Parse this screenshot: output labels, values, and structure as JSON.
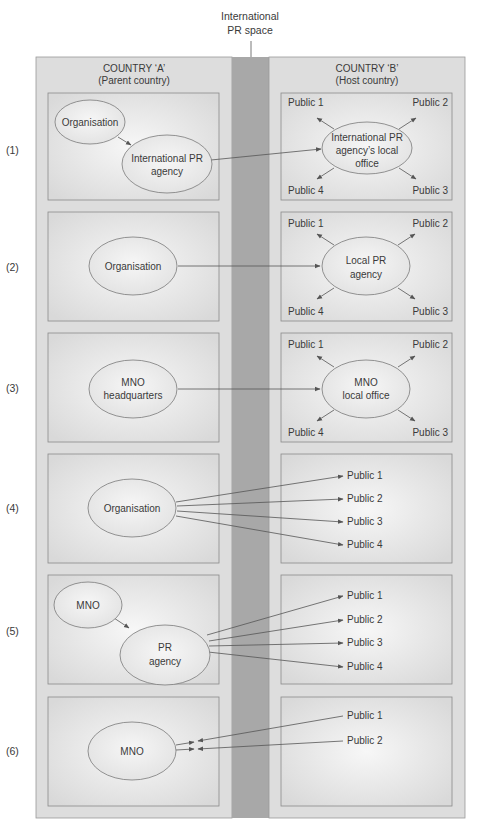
{
  "header": {
    "space_label_line1": "International",
    "space_label_line2": "PR space"
  },
  "columns": {
    "left": {
      "title": "COUNTRY ‘A’",
      "subtitle": "(Parent country)"
    },
    "right": {
      "title": "COUNTRY ‘B’",
      "subtitle": "(Host country)"
    }
  },
  "colors": {
    "panel": "#dcdcdc",
    "strip": "#a9a9a9",
    "box": "#e6e6e6",
    "ellipse": "#ececec",
    "stroke": "#6a6a6a"
  },
  "rows": [
    {
      "label": "(1)",
      "left_nodes": [
        {
          "lines": [
            "Organisation"
          ]
        },
        {
          "lines": [
            "International PR",
            "agency"
          ]
        }
      ],
      "right_node": {
        "lines": [
          "International PR",
          "agency’s local",
          "office"
        ]
      },
      "publics": [
        "Public 1",
        "Public 2",
        "Public 3",
        "Public 4"
      ]
    },
    {
      "label": "(2)",
      "left_nodes": [
        {
          "lines": [
            "Organisation"
          ]
        }
      ],
      "right_node": {
        "lines": [
          "Local PR",
          "agency"
        ]
      },
      "publics": [
        "Public 1",
        "Public 2",
        "Public 3",
        "Public 4"
      ]
    },
    {
      "label": "(3)",
      "left_nodes": [
        {
          "lines": [
            "MNO",
            "headquarters"
          ]
        }
      ],
      "right_node": {
        "lines": [
          "MNO",
          "local office"
        ]
      },
      "publics": [
        "Public 1",
        "Public 2",
        "Public 3",
        "Public 4"
      ]
    },
    {
      "label": "(4)",
      "left_nodes": [
        {
          "lines": [
            "Organisation"
          ]
        }
      ],
      "publics": [
        "Public 1",
        "Public 2",
        "Public 3",
        "Public 4"
      ]
    },
    {
      "label": "(5)",
      "left_nodes": [
        {
          "lines": [
            "MNO"
          ]
        },
        {
          "lines": [
            "PR",
            "agency"
          ]
        }
      ],
      "publics": [
        "Public 1",
        "Public 2",
        "Public 3",
        "Public 4"
      ]
    },
    {
      "label": "(6)",
      "left_nodes": [
        {
          "lines": [
            "MNO"
          ]
        }
      ],
      "publics": [
        "Public 1",
        "Public 2"
      ]
    }
  ]
}
